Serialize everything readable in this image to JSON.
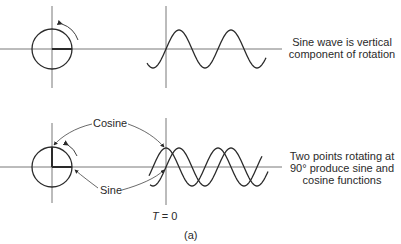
{
  "top": {
    "caption_line1": "Sine wave is vertical",
    "caption_line2": "component of rotation"
  },
  "bottom": {
    "cosine_label": "Cosine",
    "sine_label": "Sine",
    "caption_line1": "Two points rotating at",
    "caption_line2": "90° produce sine and",
    "caption_line3": "cosine functions",
    "t_label_var": "T",
    "t_label_eq": " = 0"
  },
  "figure_label": "(a)",
  "colors": {
    "line": "#2a2a2a",
    "axis": "#555555"
  }
}
